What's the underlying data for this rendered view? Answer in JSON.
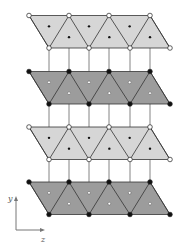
{
  "diagram": {
    "type": "layered-crystal-structure",
    "colors": {
      "light_fill": "#d6d6d6",
      "dark_fill": "#9c9c9c",
      "edge": "#333333",
      "connector": "#666666",
      "open_vertex_fill": "#ffffff",
      "solid_vertex_fill": "#111111",
      "axis": "#777777"
    },
    "geometry": {
      "top_x": [
        29,
        69,
        109,
        150
      ],
      "bottom_x": [
        49,
        89,
        130,
        170
      ],
      "layer_height": 32.5
    },
    "layers": [
      {
        "id": "layer-1",
        "shade": "light",
        "vertex_style": "open",
        "center_style": "solid",
        "y_top": 15.5
      },
      {
        "id": "layer-2",
        "shade": "dark",
        "vertex_style": "solid",
        "center_style": "open",
        "y_top": 71.5
      },
      {
        "id": "layer-3",
        "shade": "light",
        "vertex_style": "open",
        "center_style": "solid",
        "y_top": 127
      },
      {
        "id": "layer-4",
        "shade": "dark",
        "vertex_style": "solid",
        "center_style": "open",
        "y_top": 182
      }
    ],
    "connectors_x": [
      49,
      69,
      89,
      109,
      130,
      150
    ],
    "axes": {
      "vertical_label": "y",
      "horizontal_label": "z",
      "origin": [
        16,
        230
      ],
      "vertical_tip": [
        16,
        196
      ],
      "horizontal_tip": [
        45,
        230
      ]
    }
  }
}
